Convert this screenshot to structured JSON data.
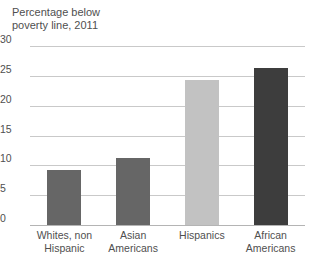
{
  "chart_data": {
    "type": "bar",
    "title": "Percentage below\npoverty line, 2011",
    "xlabel": "",
    "ylabel": "",
    "ylim": [
      0,
      30
    ],
    "yticks": [
      0,
      5,
      10,
      15,
      20,
      25,
      30
    ],
    "ytick_labels": [
      "0",
      "5",
      "10",
      "15",
      "20",
      "25",
      "30"
    ],
    "grid": true,
    "legend": "none",
    "categories": [
      "Whites, non\nHispanic",
      "Asian\nAmericans",
      "Hispanics",
      "African\nAmericans"
    ],
    "values": [
      9.3,
      11.2,
      24.3,
      26.3
    ],
    "bar_colors": [
      "#666666",
      "#666666",
      "#c2c2c2",
      "#3d3d3d"
    ]
  },
  "colors": {
    "background": "#ffffff",
    "text": "#4f4f4f",
    "gridline": "#c9c9c9",
    "axis": "#b4b4b4"
  }
}
